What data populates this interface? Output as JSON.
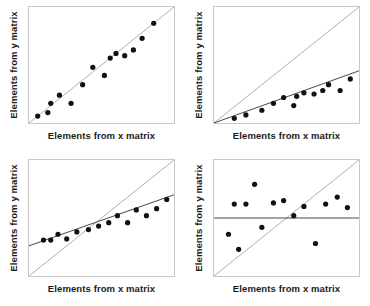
{
  "figure": {
    "background_color": "#ffffff",
    "point_color": "#111111",
    "identity_line_color": "#9a9a9a",
    "regression_line_color": "#333333",
    "frame_color": "#c8c8c8"
  },
  "chart_data": [
    {
      "id": "panel-1",
      "type": "scatter",
      "title": "",
      "xlabel": "Elements from x matrix",
      "ylabel": "Elements from y matrix",
      "xlim": [
        0,
        1
      ],
      "ylim": [
        0,
        1
      ],
      "grid": false,
      "legend": "none",
      "identity_line": {
        "x": [
          0,
          1
        ],
        "y": [
          0,
          1
        ]
      },
      "regression_line": null,
      "points": {
        "x": [
          0.06,
          0.13,
          0.15,
          0.21,
          0.29,
          0.37,
          0.44,
          0.52,
          0.56,
          0.6,
          0.66,
          0.72,
          0.78,
          0.86
        ],
        "y": [
          0.06,
          0.09,
          0.17,
          0.24,
          0.17,
          0.33,
          0.48,
          0.41,
          0.56,
          0.6,
          0.58,
          0.63,
          0.73,
          0.86
        ]
      }
    },
    {
      "id": "panel-2",
      "type": "scatter",
      "title": "",
      "xlabel": "Elements from x matrix",
      "ylabel": "Elements from y matrix",
      "xlim": [
        0,
        1
      ],
      "ylim": [
        0,
        1
      ],
      "grid": false,
      "legend": "none",
      "identity_line": {
        "x": [
          0,
          1
        ],
        "y": [
          0,
          1
        ]
      },
      "regression_line": {
        "x": [
          0,
          1
        ],
        "y": [
          0.0,
          0.45
        ]
      },
      "points": {
        "x": [
          0.14,
          0.22,
          0.33,
          0.41,
          0.48,
          0.55,
          0.57,
          0.62,
          0.69,
          0.75,
          0.79,
          0.87,
          0.94
        ],
        "y": [
          0.04,
          0.07,
          0.11,
          0.17,
          0.22,
          0.15,
          0.23,
          0.26,
          0.25,
          0.28,
          0.33,
          0.28,
          0.38
        ]
      }
    },
    {
      "id": "panel-3",
      "type": "scatter",
      "title": "",
      "xlabel": "Elements from x matrix",
      "ylabel": "Elements from y matrix",
      "xlim": [
        0,
        1
      ],
      "ylim": [
        0,
        1
      ],
      "grid": false,
      "legend": "none",
      "identity_line": {
        "x": [
          0,
          1
        ],
        "y": [
          0,
          1
        ]
      },
      "regression_line": {
        "x": [
          0,
          1
        ],
        "y": [
          0.26,
          0.7
        ]
      },
      "points": {
        "x": [
          0.1,
          0.15,
          0.2,
          0.26,
          0.33,
          0.41,
          0.48,
          0.55,
          0.61,
          0.68,
          0.74,
          0.81,
          0.88,
          0.95
        ],
        "y": [
          0.31,
          0.31,
          0.36,
          0.32,
          0.38,
          0.4,
          0.43,
          0.46,
          0.52,
          0.46,
          0.57,
          0.52,
          0.58,
          0.66
        ]
      }
    },
    {
      "id": "panel-4",
      "type": "scatter",
      "title": "",
      "xlabel": "Elements from x matrix",
      "ylabel": "Elements from y matrix",
      "xlim": [
        0,
        1
      ],
      "ylim": [
        0,
        1
      ],
      "grid": false,
      "legend": "none",
      "identity_line": {
        "x": [
          0,
          1
        ],
        "y": [
          0,
          1
        ]
      },
      "regression_line": {
        "x": [
          0,
          1
        ],
        "y": [
          0.5,
          0.5
        ]
      },
      "points": {
        "x": [
          0.1,
          0.14,
          0.17,
          0.22,
          0.28,
          0.33,
          0.41,
          0.48,
          0.55,
          0.62,
          0.7,
          0.77,
          0.85,
          0.92
        ],
        "y": [
          0.36,
          0.62,
          0.23,
          0.62,
          0.79,
          0.42,
          0.63,
          0.65,
          0.52,
          0.6,
          0.28,
          0.62,
          0.68,
          0.59
        ]
      }
    }
  ]
}
